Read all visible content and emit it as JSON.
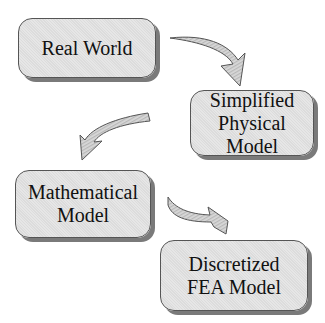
{
  "diagram": {
    "nodes": [
      {
        "id": "real-world",
        "lines": [
          "Real World"
        ]
      },
      {
        "id": "simplified-physical-model",
        "lines": [
          "Simplified",
          "Physical Model"
        ]
      },
      {
        "id": "mathematical-model",
        "lines": [
          "Mathematical",
          "Model"
        ]
      },
      {
        "id": "discretized-fea-model",
        "lines": [
          "Discretized",
          "FEA Model"
        ]
      }
    ],
    "edges": [
      {
        "from": "real-world",
        "to": "simplified-physical-model"
      },
      {
        "from": "simplified-physical-model",
        "to": "mathematical-model"
      },
      {
        "from": "mathematical-model",
        "to": "discretized-fea-model"
      }
    ],
    "colors": {
      "box_fill": "#e0e0e0",
      "box_border": "#555555",
      "shadow": "#7a7a7a",
      "arrow_fill": "#cfcfcf"
    }
  }
}
